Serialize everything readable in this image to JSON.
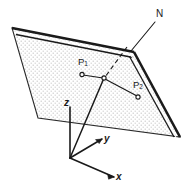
{
  "figure": {
    "kind": "geometry-diagram",
    "background_color": "#ffffff",
    "ink_color": "#1a1a1a",
    "fill": {
      "name": "stipple-fill",
      "dot_color": "#cfcfcf",
      "base_color": "#ffffff"
    },
    "labels": {
      "normal": "N",
      "point1": "P",
      "point1_sub": "1",
      "point2": "P",
      "point2_sub": "2",
      "axis_x": "x",
      "axis_y": "y",
      "axis_z": "z"
    },
    "geometry": {
      "plane_vertices": "12,28 134,52 180,137 38,118",
      "plane_edge_thick": "top-right",
      "normal_leader": "134,52 156,20",
      "normal_dashed": "126,46 104,78",
      "junction": "104,78",
      "p1_marker": "82,74",
      "p2_marker": "138,97",
      "axes_origin": "70,158",
      "axis_z_tip": "70,106",
      "axis_y_tip": "104,138",
      "axis_x_tip": "116,178",
      "origin_to_junction": "70,158 104,78"
    }
  }
}
